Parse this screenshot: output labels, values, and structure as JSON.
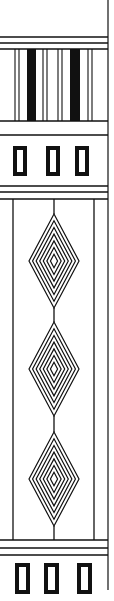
{
  "ornament": {
    "description": "Vertical decorative border strip with striped band, rectangle rows, and nested diamond panel",
    "colors": {
      "ink": "#111111",
      "background": "#ffffff"
    },
    "right_border_x": 108,
    "top_lines_y": [
      37,
      43,
      49
    ],
    "bars_section": {
      "top": 49,
      "bottom": 121,
      "thin_lines_x": [
        15,
        19,
        43,
        47,
        58,
        62,
        88,
        92
      ],
      "thick_bars": [
        {
          "x": 27,
          "w": 9
        },
        {
          "x": 70,
          "w": 10
        }
      ]
    },
    "mid_line_y": 135,
    "top_boxes": {
      "y": 146,
      "h": 30,
      "w": 14,
      "x": [
        13,
        46,
        75
      ]
    },
    "panel_lines_top_y": [
      186,
      192,
      199
    ],
    "panel": {
      "left_x": 13,
      "right_x": 94,
      "top": 199,
      "bottom": 540,
      "stem_x": 54
    },
    "diamonds": [
      {
        "cy": 261,
        "half_h": 47,
        "half_w": 25
      },
      {
        "cy": 369,
        "half_h": 47,
        "half_w": 25
      },
      {
        "cy": 479,
        "half_h": 47,
        "half_w": 25
      }
    ],
    "diamond_rings": 7,
    "panel_lines_bottom_y": [
      540,
      548,
      555
    ],
    "bottom_boxes": {
      "y": 563,
      "h": 31,
      "w": 15,
      "x": [
        15,
        44,
        77
      ]
    },
    "right_border_bottom": 590
  }
}
